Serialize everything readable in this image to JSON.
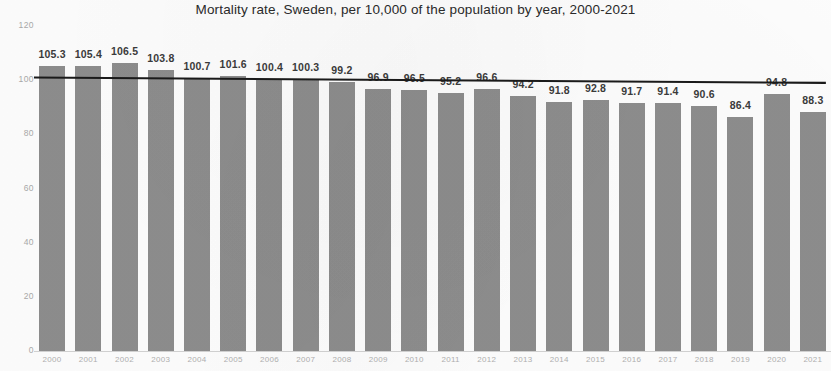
{
  "chart_data": {
    "type": "bar",
    "title": "Mortality rate, Sweden, per 10,000 of the population by year, 2000-2021",
    "xlabel": "",
    "ylabel": "",
    "categories": [
      "2000",
      "2001",
      "2002",
      "2003",
      "2004",
      "2005",
      "2006",
      "2007",
      "2008",
      "2009",
      "2010",
      "2011",
      "2012",
      "2013",
      "2014",
      "2015",
      "2016",
      "2017",
      "2018",
      "2019",
      "2020",
      "2021"
    ],
    "values": [
      105.3,
      105.4,
      106.5,
      103.8,
      100.7,
      101.6,
      100.4,
      100.3,
      99.2,
      96.9,
      96.5,
      95.2,
      96.6,
      94.2,
      91.8,
      92.8,
      91.7,
      91.4,
      90.6,
      86.4,
      94.8,
      88.3
    ],
    "data_labels": [
      "105.3",
      "105.4",
      "106.5",
      "103.8",
      "100.7",
      "101.6",
      "100.4",
      "100.3",
      "99.2",
      "96.9",
      "96.5",
      "95.2",
      "96.6",
      "94.2",
      "91.8",
      "92.8",
      "91.7",
      "91.4",
      "90.6",
      "86.4",
      "94.8",
      "88.3"
    ],
    "ylim": [
      0,
      120
    ],
    "yticks": [
      0,
      20,
      40,
      60,
      80,
      100,
      120
    ],
    "ytick_labels": [
      "0",
      "20",
      "40",
      "60",
      "80",
      "100",
      "120"
    ],
    "grid": false,
    "legend": "none",
    "bar_color": "#8d8d8d",
    "annotations": [
      {
        "name": "trendline",
        "type": "linear-trendline",
        "color": "#1a1a1a",
        "start_value": 101.0,
        "end_value": 99.0
      }
    ]
  }
}
